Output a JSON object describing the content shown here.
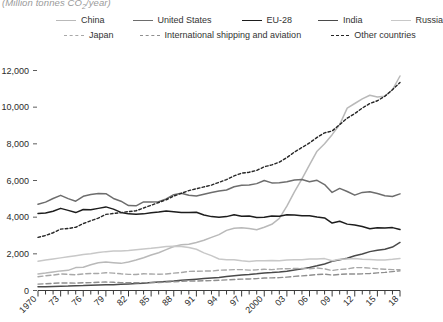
{
  "chart": {
    "axis_title": "(Million tonnes CO2/year)",
    "axis_title_main": "(Million tonnes CO",
    "axis_title_sub": "2",
    "axis_title_tail": "/year)"
  },
  "legend": {
    "row1": [
      {
        "label": "China",
        "style": "solid",
        "color": "#b9b9b9"
      },
      {
        "label": "United States",
        "style": "solid",
        "color": "#6d6d6d"
      },
      {
        "label": "EU-28",
        "style": "solid",
        "color": "#1d1d1d"
      },
      {
        "label": "India",
        "style": "solid",
        "color": "#4a4a4a"
      },
      {
        "label": "Russia",
        "style": "solid",
        "color": "#c8c8c8"
      }
    ],
    "row2": [
      {
        "label": "Japan",
        "style": "dash-long",
        "color": "#a8a8a8"
      },
      {
        "label": "International shipping and aviation",
        "style": "dash-long",
        "color": "#8f8f8f"
      },
      {
        "label": "Other countries",
        "style": "dash-short",
        "color": "#262626"
      }
    ]
  },
  "chart_data": {
    "type": "line",
    "title": "(Million tonnes CO2/year)",
    "xlabel": "",
    "ylabel": "Million tonnes CO2/year",
    "xlim": [
      1970,
      2018
    ],
    "ylim": [
      0,
      12000
    ],
    "yticks": [
      0,
      2000,
      4000,
      6000,
      8000,
      10000,
      12000
    ],
    "ytick_labels": [
      "0",
      "2,000",
      "4,000",
      "6,000",
      "8,000",
      "10,000",
      "12,000"
    ],
    "xticks": [
      1970,
      1973,
      1976,
      1979,
      1982,
      1985,
      1988,
      1991,
      1994,
      1997,
      2000,
      2003,
      2006,
      2009,
      2012,
      2015,
      2018
    ],
    "xtick_labels": [
      "1970",
      "73",
      "76",
      "79",
      "82",
      "85",
      "88",
      "91",
      "94",
      "97",
      "2000",
      "03",
      "06",
      "09",
      "12",
      "15",
      "18"
    ],
    "grid": false,
    "legend_position": "top",
    "x": [
      1970,
      1971,
      1972,
      1973,
      1974,
      1975,
      1976,
      1977,
      1978,
      1979,
      1980,
      1981,
      1982,
      1983,
      1984,
      1985,
      1986,
      1987,
      1988,
      1989,
      1990,
      1991,
      1992,
      1993,
      1994,
      1995,
      1996,
      1997,
      1998,
      1999,
      2000,
      2001,
      2002,
      2003,
      2004,
      2005,
      2006,
      2007,
      2008,
      2009,
      2010,
      2011,
      2012,
      2013,
      2014,
      2015,
      2016,
      2017,
      2018
    ],
    "series": [
      {
        "name": "China",
        "style": "solid",
        "color": "#b9b9b9",
        "values": [
          900,
          950,
          1010,
          1070,
          1100,
          1250,
          1270,
          1400,
          1510,
          1560,
          1520,
          1480,
          1560,
          1660,
          1790,
          1940,
          2060,
          2230,
          2400,
          2500,
          2520,
          2620,
          2740,
          2900,
          3050,
          3280,
          3400,
          3420,
          3380,
          3310,
          3450,
          3610,
          3930,
          4600,
          5380,
          6090,
          6850,
          7600,
          8000,
          8500,
          9050,
          9950,
          10200,
          10450,
          10650,
          10550,
          10600,
          10950,
          11700
        ]
      },
      {
        "name": "United States",
        "style": "solid",
        "color": "#6d6d6d",
        "values": [
          4700,
          4820,
          5020,
          5190,
          5010,
          4870,
          5140,
          5240,
          5290,
          5280,
          5020,
          4870,
          4630,
          4620,
          4830,
          4830,
          4840,
          5000,
          5230,
          5300,
          5200,
          5150,
          5250,
          5350,
          5430,
          5480,
          5660,
          5740,
          5760,
          5830,
          6000,
          5870,
          5880,
          5930,
          6030,
          6050,
          5930,
          6010,
          5780,
          5350,
          5570,
          5400,
          5200,
          5350,
          5390,
          5290,
          5170,
          5130,
          5270
        ]
      },
      {
        "name": "EU-28",
        "style": "solid",
        "color": "#1d1d1d",
        "values": [
          4200,
          4230,
          4320,
          4480,
          4370,
          4250,
          4420,
          4400,
          4480,
          4560,
          4440,
          4260,
          4180,
          4160,
          4180,
          4240,
          4280,
          4340,
          4300,
          4250,
          4260,
          4270,
          4120,
          4030,
          3990,
          4030,
          4130,
          4050,
          4060,
          3980,
          3990,
          4060,
          4050,
          4130,
          4120,
          4080,
          4080,
          4010,
          3960,
          3680,
          3780,
          3620,
          3570,
          3490,
          3370,
          3420,
          3410,
          3430,
          3330
        ]
      },
      {
        "name": "India",
        "style": "solid",
        "color": "#4a4a4a",
        "values": [
          200,
          210,
          220,
          230,
          240,
          260,
          270,
          290,
          300,
          310,
          320,
          340,
          360,
          380,
          400,
          430,
          460,
          490,
          520,
          560,
          590,
          620,
          650,
          680,
          710,
          760,
          800,
          840,
          870,
          910,
          960,
          980,
          1010,
          1050,
          1120,
          1180,
          1260,
          1350,
          1450,
          1590,
          1680,
          1760,
          1900,
          1990,
          2120,
          2190,
          2250,
          2370,
          2620
        ]
      },
      {
        "name": "Russia",
        "style": "solid",
        "color": "#c8c8c8",
        "values": [
          1600,
          1660,
          1720,
          1780,
          1840,
          1900,
          1960,
          2010,
          2070,
          2120,
          2150,
          2160,
          2180,
          2220,
          2260,
          2300,
          2350,
          2400,
          2420,
          2400,
          2350,
          2250,
          2050,
          1900,
          1720,
          1680,
          1680,
          1620,
          1580,
          1620,
          1620,
          1630,
          1620,
          1660,
          1680,
          1680,
          1720,
          1720,
          1740,
          1620,
          1700,
          1720,
          1740,
          1700,
          1690,
          1660,
          1670,
          1700,
          1750
        ]
      },
      {
        "name": "Japan",
        "style": "dash-long",
        "color": "#a8a8a8",
        "values": [
          750,
          800,
          840,
          900,
          880,
          860,
          900,
          930,
          930,
          970,
          950,
          910,
          880,
          870,
          910,
          900,
          890,
          900,
          950,
          980,
          1040,
          1050,
          1060,
          1060,
          1110,
          1120,
          1140,
          1140,
          1110,
          1130,
          1160,
          1140,
          1180,
          1190,
          1200,
          1200,
          1190,
          1230,
          1180,
          1090,
          1150,
          1180,
          1250,
          1250,
          1220,
          1180,
          1160,
          1140,
          1130
        ]
      },
      {
        "name": "International shipping and aviation",
        "style": "dash-long",
        "color": "#8f8f8f",
        "values": [
          350,
          370,
          390,
          410,
          410,
          400,
          420,
          430,
          450,
          460,
          450,
          430,
          420,
          420,
          430,
          430,
          440,
          460,
          480,
          500,
          520,
          520,
          530,
          540,
          560,
          580,
          600,
          620,
          630,
          650,
          680,
          690,
          700,
          730,
          770,
          800,
          830,
          870,
          890,
          840,
          880,
          900,
          900,
          910,
          930,
          960,
          990,
          1030,
          1070
        ]
      },
      {
        "name": "Other countries",
        "style": "dash-short",
        "color": "#262626",
        "values": [
          2900,
          3000,
          3150,
          3350,
          3380,
          3450,
          3650,
          3800,
          3950,
          4150,
          4200,
          4250,
          4300,
          4350,
          4500,
          4650,
          4800,
          4950,
          5150,
          5300,
          5450,
          5550,
          5650,
          5750,
          5900,
          6050,
          6250,
          6400,
          6450,
          6550,
          6750,
          6850,
          7000,
          7250,
          7550,
          7800,
          8050,
          8350,
          8600,
          8700,
          9050,
          9400,
          9650,
          9950,
          10200,
          10350,
          10600,
          10950,
          11350
        ]
      }
    ]
  }
}
